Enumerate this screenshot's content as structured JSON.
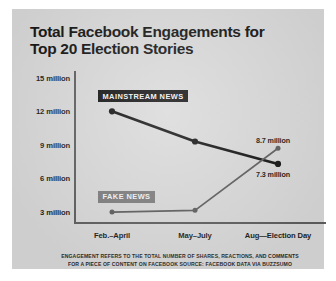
{
  "title": "Total Facebook Engagements for\nTop 20 Election Stories",
  "title_line1": "Total Facebook Engagements for",
  "title_line2": "Top 20 Election Stories",
  "legend": {
    "mainstream_label": "MAINSTREAM NEWS",
    "fake_label": "FAKE NEWS"
  },
  "annotations": {
    "fake_end_label": "8.7 million",
    "mainstream_end_label": "7.3 million"
  },
  "footnote": {
    "line1": "ENGAGEMENT REFERS TO THE TOTAL NUMBER OF SHARES, REACTIONS, AND COMMENTS",
    "line2": "FOR A PIECE OF CONTENT ON FACEBOOK SOURCE: FACEBOOK DATA VIA BUZZSUMO"
  },
  "colors": {
    "card_background": "#d9d9d9",
    "page_background": "#ffffff",
    "mainstream_line": "#111111",
    "fake_line": "#5c5c5c",
    "axis": "#5e5e5e",
    "text": "#131313"
  },
  "chart_data": {
    "type": "line",
    "title": "Total Facebook Engagements for Top 20 Election Stories",
    "xlabel": "",
    "ylabel": "",
    "categories": [
      "Feb.–April",
      "May–July",
      "Aug—Election Day"
    ],
    "ytick_labels": [
      "15 million",
      "12 million",
      "9 million",
      "6 million",
      "3 million"
    ],
    "ytick_values": [
      15,
      12,
      9,
      6,
      3
    ],
    "ylim": [
      2.2,
      15.6
    ],
    "grid": false,
    "legend_position": "inline-annotation",
    "series": [
      {
        "name": "MAINSTREAM NEWS",
        "color": "#111111",
        "values": [
          12.0,
          9.3,
          7.3
        ],
        "end_label": "7.3 million"
      },
      {
        "name": "FAKE NEWS",
        "color": "#5c5c5c",
        "values": [
          3.0,
          3.15,
          8.7
        ],
        "end_label": "8.7 million"
      }
    ],
    "units": "millions of engagements",
    "note": "ENGAGEMENT REFERS TO THE TOTAL NUMBER OF SHARES, REACTIONS, AND COMMENTS FOR A PIECE OF CONTENT ON FACEBOOK SOURCE: FACEBOOK DATA VIA BUZZSUMO"
  }
}
